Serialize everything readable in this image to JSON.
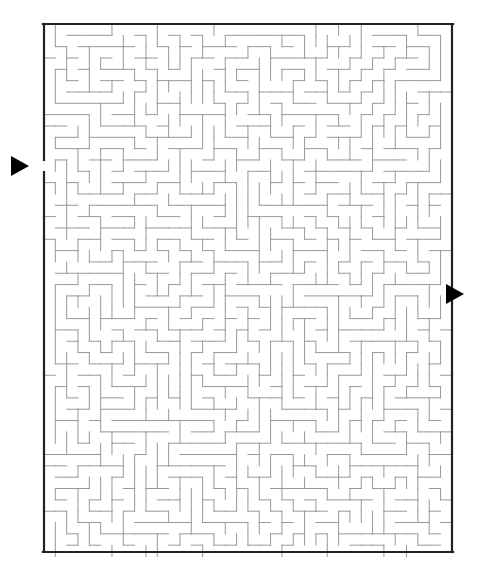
{
  "page": {
    "width": 489,
    "height": 577,
    "background_color": "#ffffff"
  },
  "maze": {
    "name": "rectangular-perfect-maze",
    "columns": 36,
    "rows": 47,
    "cell_size": 11.33,
    "origin_x": 44,
    "origin_y": 24,
    "pixel_width": 408,
    "pixel_height": 528,
    "border_color": "#222222",
    "border_width": 2.2,
    "wall_color": "#999999",
    "wall_width": 1,
    "entrance": {
      "name": "entrance",
      "side": "left",
      "row": 12,
      "gap_y_start": 160,
      "gap_y_end": 172,
      "marker": "triangle-right",
      "marker_color": "#000000",
      "marker_x": 20,
      "marker_y": 166
    },
    "exit": {
      "name": "exit",
      "side": "right",
      "row": 23,
      "gap_y_start": 289,
      "gap_y_end": 300,
      "marker": "triangle-right",
      "marker_color": "#000000",
      "marker_x": 455,
      "marker_y": 294
    },
    "seed": 20240517
  }
}
